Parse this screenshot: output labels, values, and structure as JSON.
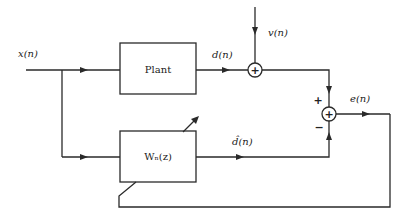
{
  "diagram": {
    "title": "",
    "signals": {
      "input": "x(n)",
      "plant_output": "d(n)",
      "noise": "v(n)",
      "filter_output": "d̂(n)",
      "error": "e(n)"
    },
    "blocks": {
      "plant": "Plant",
      "filter": "Wₙ(z)"
    },
    "junctions": {
      "sum1_symbol": "+",
      "sum2_symbol": "+",
      "sum2_plus_sign": "+",
      "sum2_minus_sign": "−"
    }
  }
}
